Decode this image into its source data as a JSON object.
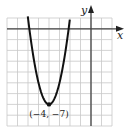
{
  "chart_data": {
    "type": "line",
    "title": "",
    "function": "y = 2(x + 4)^2 - 7",
    "xlabel": "x",
    "ylabel": "y",
    "xlim": [
      -8,
      2
    ],
    "ylim": [
      -9,
      1
    ],
    "grid": true,
    "grid_step": 1,
    "tick_labels": false,
    "series": [
      {
        "name": "parabola",
        "x": [
          -6,
          -5.5,
          -5,
          -4.5,
          -4,
          -3.5,
          -3,
          -2.5,
          -2
        ],
        "y": [
          1,
          -2.5,
          -5,
          -6.5,
          -7,
          -6.5,
          -5,
          -2.5,
          1
        ]
      }
    ],
    "annotations": [
      {
        "text": "(−4, −7)",
        "x": -4,
        "y": -7,
        "type": "vertex"
      }
    ],
    "colors": {
      "grid": "#c8c8c8",
      "axis": "#444444",
      "curve": "#111111"
    }
  },
  "labels": {
    "x_axis": "x",
    "y_axis": "y",
    "vertex": "(−4, −7)"
  }
}
